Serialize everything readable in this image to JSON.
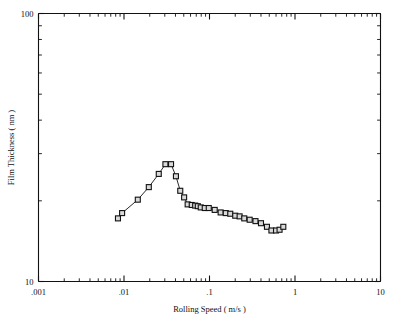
{
  "figure": {
    "background": "#ffffff",
    "frame_color": "#111111",
    "marker_fill": "#d9d9d9",
    "marker_edge": "#111111",
    "line_color": "#111111"
  },
  "chart_data": {
    "type": "line",
    "title": "",
    "subtitle": "",
    "xlabel": "Rolling Speed    ( m/s )",
    "ylabel": "Film Thickness    ( nm )",
    "xscale": "log",
    "yscale": "log",
    "xlim": [
      0.001,
      10
    ],
    "ylim": [
      10,
      100
    ],
    "grid": false,
    "legend": null,
    "xticks": [
      0.001,
      0.01,
      0.1,
      1,
      10
    ],
    "xtick_labels": [
      ".001",
      ".01",
      ".1",
      "1",
      "10"
    ],
    "yticks": [
      10,
      100
    ],
    "ytick_labels": [
      "10",
      "100"
    ],
    "yminor_ticks": [
      20,
      30,
      40,
      50,
      60,
      70,
      80,
      90
    ],
    "marker": "open-square",
    "series": [
      {
        "name": "Film thickness vs rolling speed",
        "x": [
          0.0085,
          0.0095,
          0.0145,
          0.0195,
          0.0255,
          0.0305,
          0.0355,
          0.0405,
          0.0455,
          0.0505,
          0.0555,
          0.062,
          0.068,
          0.073,
          0.079,
          0.088,
          0.098,
          0.115,
          0.135,
          0.155,
          0.175,
          0.2,
          0.225,
          0.255,
          0.295,
          0.345,
          0.4,
          0.47,
          0.53,
          0.6,
          0.66,
          0.73
        ],
        "y": [
          17.2,
          18.0,
          20.2,
          22.5,
          25.2,
          27.4,
          27.4,
          24.7,
          21.8,
          20.6,
          19.4,
          19.3,
          19.2,
          19.1,
          18.9,
          18.8,
          18.8,
          18.5,
          18.1,
          18.0,
          17.9,
          17.6,
          17.5,
          17.2,
          17.0,
          16.8,
          16.5,
          16.0,
          15.5,
          15.5,
          15.6,
          16.0
        ]
      }
    ],
    "annotations": []
  }
}
